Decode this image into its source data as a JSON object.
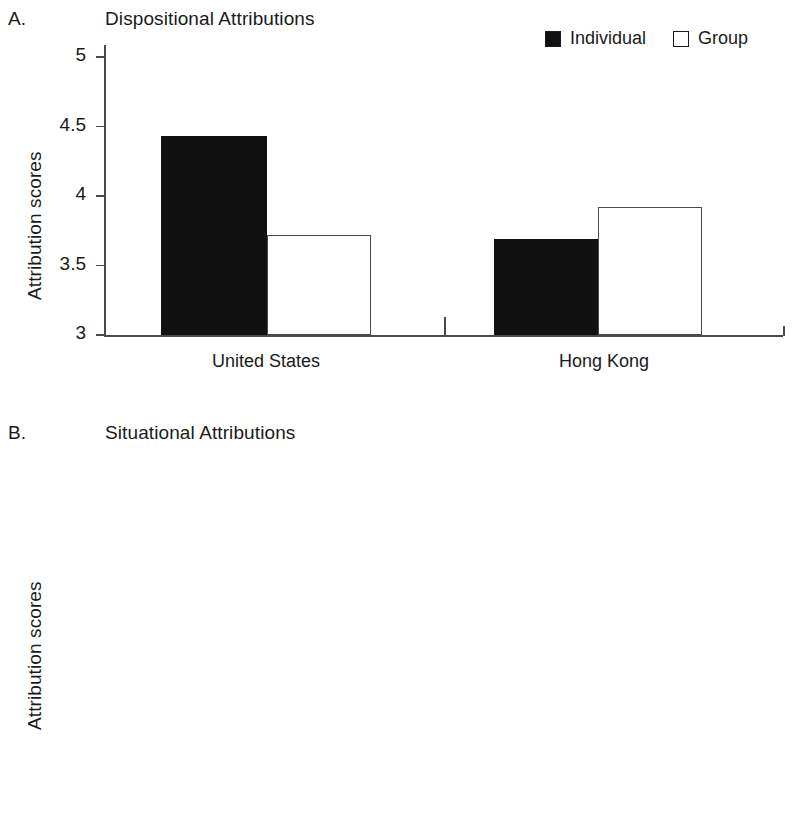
{
  "figure": {
    "background_color": "#ffffff",
    "fill_color_individual": "#111111",
    "fill_color_group": "#ffffff",
    "line_color": "#4a4a4a"
  },
  "legend": {
    "position": "top-right",
    "entries": [
      {
        "label": "Individual",
        "swatch": "filled-square-icon"
      },
      {
        "label": "Group",
        "swatch": "hollow-square-icon"
      }
    ]
  },
  "panels": [
    {
      "letter": "A.",
      "title": "Dispositional Attributions",
      "ylabel": "Attribution scores",
      "yticks": [
        "3",
        "3.5",
        "4",
        "4.5",
        "5"
      ],
      "ytick_values": [
        3,
        3.5,
        4,
        4.5,
        5
      ],
      "ylim": [
        3,
        5
      ],
      "categories": [
        "United States",
        "Hong Kong"
      ],
      "bars": [
        {
          "group": "United States",
          "series": "Individual",
          "value": 4.43
        },
        {
          "group": "United States",
          "series": "Group",
          "value": 3.72
        },
        {
          "group": "Hong Kong",
          "series": "Individual",
          "value": 3.69
        },
        {
          "group": "Hong Kong",
          "series": "Group",
          "value": 3.92
        }
      ]
    },
    {
      "letter": "B.",
      "title": "Situational Attributions",
      "ylabel": "Attribution scores",
      "yticks": [
        "4",
        "4.2",
        "4.4",
        "4.6",
        "4.8",
        "5"
      ],
      "ytick_values": [
        4,
        4.2,
        4.4,
        4.6,
        4.8,
        5
      ],
      "ylim": [
        4,
        5
      ],
      "categories": [
        "United States",
        "Hong Kong"
      ],
      "bars": [
        {
          "group": "United States",
          "series": "Individual",
          "value": 4.455
        },
        {
          "group": "United States",
          "series": "Group",
          "value": 4.86
        },
        {
          "group": "Hong Kong",
          "series": "Individual",
          "value": 5.045
        },
        {
          "group": "Hong Kong",
          "series": "Group",
          "value": 4.97
        }
      ]
    }
  ],
  "chart_data": [
    {
      "type": "bar",
      "title": "Dispositional Attributions",
      "panel": "A",
      "xlabel": "",
      "ylabel": "Attribution scores",
      "ylim": [
        3,
        5
      ],
      "yticks": [
        3,
        3.5,
        4,
        4.5,
        5
      ],
      "grid": false,
      "legend": "top-right",
      "categories": [
        "United States",
        "Hong Kong"
      ],
      "series": [
        {
          "name": "Individual",
          "values": [
            4.43,
            3.69
          ]
        },
        {
          "name": "Group",
          "values": [
            3.72,
            3.92
          ]
        }
      ]
    },
    {
      "type": "bar",
      "title": "Situational Attributions",
      "panel": "B",
      "xlabel": "",
      "ylabel": "Attribution scores",
      "ylim": [
        4,
        5
      ],
      "yticks": [
        4,
        4.2,
        4.4,
        4.6,
        4.8,
        5
      ],
      "grid": false,
      "legend": "top-right",
      "categories": [
        "United States",
        "Hong Kong"
      ],
      "series": [
        {
          "name": "Individual",
          "values": [
            4.455,
            5.045
          ]
        },
        {
          "name": "Group",
          "values": [
            4.86,
            4.97
          ]
        }
      ]
    }
  ]
}
